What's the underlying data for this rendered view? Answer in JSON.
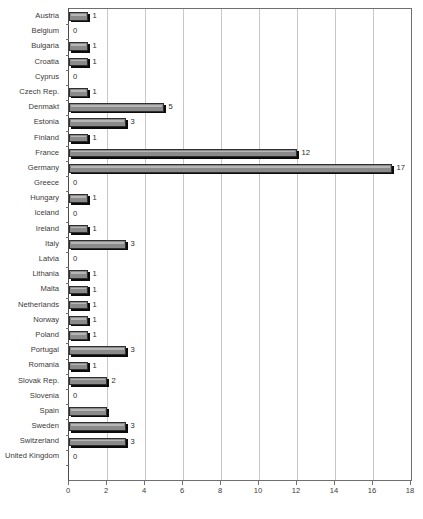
{
  "chart_data": {
    "type": "bar",
    "orientation": "horizontal",
    "title": "",
    "xlabel": "",
    "ylabel": "",
    "xlim": [
      0,
      18
    ],
    "xticks": [
      0,
      2,
      4,
      6,
      8,
      10,
      12,
      14,
      16,
      18
    ],
    "grid": true,
    "legend": false,
    "bar_color": "#8a8a8a",
    "bar_edge_color": "#2f2f2f",
    "shadow_color": "#0b0b0b",
    "gridline_color": "#c8c8c8",
    "axis_color": "#6f6f6f",
    "categories": [
      "Austria",
      "Belgium",
      "Bulgaria",
      "Croatia",
      "Cyprus",
      "Czech Rep.",
      "Denmakt",
      "Estonia",
      "Finland",
      "France",
      "Germany",
      "Greece",
      "Hungary",
      "Iceland",
      "Ireland",
      "Italy",
      "Latvia",
      "Lithania",
      "Malta",
      "Netherlands",
      "Norway",
      "Poland",
      "Portugal",
      "Romania",
      "Slovak Rep.",
      "Slovenia",
      "Spain",
      "Sweden",
      "Switzerland",
      "United Kingdom"
    ],
    "values": [
      1,
      0,
      1,
      1,
      0,
      1,
      5,
      3,
      1,
      12,
      17,
      0,
      1,
      0,
      1,
      3,
      0,
      1,
      1,
      1,
      1,
      1,
      3,
      1,
      2,
      0,
      2,
      3,
      3,
      0
    ],
    "value_labels": [
      "1",
      "0",
      "1",
      "1",
      "0",
      "1",
      "5",
      "3",
      "1",
      "12",
      "17",
      "0",
      "1",
      "0",
      "1",
      "3",
      "0",
      "1",
      "1",
      "1",
      "1",
      "1",
      "3",
      "1",
      "2",
      "0",
      "",
      "3",
      "3",
      "0"
    ]
  }
}
